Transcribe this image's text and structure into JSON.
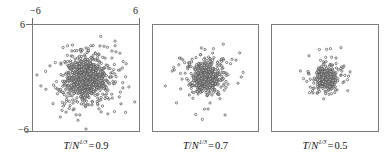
{
  "figure": {
    "axes": {
      "x_label_left": "−6",
      "x_label_right": "6",
      "y_label_top": "6",
      "y_label_bottom": "−6",
      "xlim": [
        -6,
        6
      ],
      "ylim": [
        -6,
        6
      ],
      "ticks_x": [
        -6,
        6
      ],
      "ticks_y": [
        -6,
        6
      ],
      "grid": false,
      "frame_color": "#7d7d7d",
      "marker_color": "#555555",
      "marker_fill": "#ffffff"
    },
    "captions": [
      {
        "var_t": "T",
        "slash": "/",
        "var_n": "N",
        "exp": "1/3",
        "eq": "=",
        "value": "0.9"
      },
      {
        "var_t": "T",
        "slash": "/",
        "var_n": "N",
        "exp": "1/3",
        "eq": "=",
        "value": "0.7"
      },
      {
        "var_t": "T",
        "slash": "/",
        "var_n": "N",
        "exp": "1/3",
        "eq": "=",
        "value": "0.5"
      }
    ]
  },
  "chart_data": {
    "type": "scatter",
    "title": "",
    "xlabel": "",
    "ylabel": "",
    "xlim": [
      -6,
      6
    ],
    "ylim": [
      -6,
      6
    ],
    "grid": false,
    "legend": "none",
    "marker": "open-circle",
    "panels": [
      {
        "label": "T/N^(1/3) = 0.9",
        "n_points": 900,
        "sigma": 1.95,
        "seed": 11,
        "core_fraction": 0.55,
        "core_sigma": 0.95
      },
      {
        "label": "T/N^(1/3) = 0.7",
        "n_points": 560,
        "sigma": 1.45,
        "seed": 27,
        "core_fraction": 0.62,
        "core_sigma": 0.7
      },
      {
        "label": "T/N^(1/3) = 0.5",
        "n_points": 420,
        "sigma": 1.15,
        "seed": 43,
        "core_fraction": 0.7,
        "core_sigma": 0.5
      }
    ]
  }
}
